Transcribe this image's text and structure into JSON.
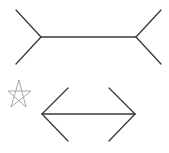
{
  "diagram": {
    "type": "muller-lyer-illusion",
    "colors": {
      "line": "#3a3a3a",
      "star": "#a8a8a8",
      "background": "#ffffff"
    },
    "figures": [
      {
        "name": "fins-out",
        "shaft": {
          "x1": 41,
          "y1": 37,
          "x2": 136,
          "y2": 37
        },
        "fins": [
          {
            "x1": 41,
            "y1": 37,
            "x2": 16,
            "y2": 10
          },
          {
            "x1": 41,
            "y1": 37,
            "x2": 16,
            "y2": 64
          },
          {
            "x1": 136,
            "y1": 37,
            "x2": 161,
            "y2": 10
          },
          {
            "x1": 136,
            "y1": 37,
            "x2": 161,
            "y2": 64
          }
        ]
      },
      {
        "name": "fins-in",
        "shaft": {
          "x1": 42,
          "y1": 114,
          "x2": 135,
          "y2": 114
        },
        "fins": [
          {
            "x1": 42,
            "y1": 114,
            "x2": 68,
            "y2": 88
          },
          {
            "x1": 42,
            "y1": 114,
            "x2": 68,
            "y2": 141
          },
          {
            "x1": 135,
            "y1": 114,
            "x2": 109,
            "y2": 88
          },
          {
            "x1": 135,
            "y1": 114,
            "x2": 109,
            "y2": 141
          }
        ]
      }
    ],
    "marker": {
      "shape": "star",
      "cx": 19,
      "cy": 94
    }
  }
}
